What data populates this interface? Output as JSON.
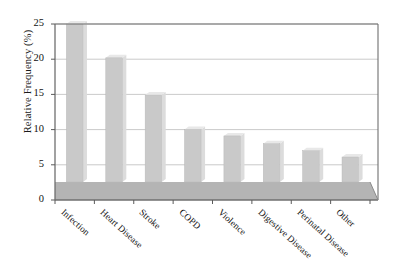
{
  "chart_data": {
    "type": "bar",
    "title": "",
    "xlabel": "",
    "ylabel": "Relative Frequency (%)",
    "categories": [
      "Infection",
      "Heart Disease",
      "Stroke",
      "COPD",
      "Violence",
      "Digestive Disease",
      "Perinatal Disease",
      "Other"
    ],
    "values": [
      25.0,
      20.2,
      14.9,
      10.0,
      9.1,
      8.0,
      7.0,
      6.1
    ],
    "ylim": [
      0,
      25
    ],
    "yticks": [
      0,
      5,
      10,
      15,
      20,
      25
    ],
    "ytick_labels": [
      "0",
      "5",
      "10",
      "15",
      "20",
      "25"
    ],
    "grid": "horizontal",
    "legend": "none",
    "style": "3d-perspective-grayscale",
    "colors": {
      "bar_face": "#c9c9c9",
      "bar_side": "#dcdcdc",
      "bar_top": "#e8e8e8",
      "floor": "#b4b4b4",
      "frame": "#6f6f6f",
      "gridline": "#c4c4c4",
      "text": "#111111"
    }
  }
}
